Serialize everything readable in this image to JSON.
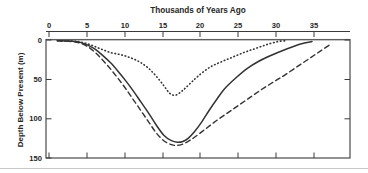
{
  "chart_data": {
    "type": "line",
    "title": "Thousands of Years Ago",
    "xlabel": "Thousands of Years Ago",
    "ylabel": "Depth Below Present (m)",
    "xlim": [
      -1.5,
      38.5
    ],
    "ylim": [
      0,
      150
    ],
    "y_inverted": true,
    "x_axis_position": "top",
    "grid": false,
    "legend": "none",
    "xticks": [
      0,
      5,
      10,
      15,
      20,
      25,
      30,
      35
    ],
    "xtick_labels": [
      "0",
      "5",
      "10",
      "15",
      "20",
      "25",
      "30",
      "35"
    ],
    "yticks": [
      0,
      50,
      100,
      150
    ],
    "ytick_labels": [
      "0",
      "50",
      "100",
      "150"
    ],
    "series": [
      {
        "name": "dotted-curve",
        "style": "dotted",
        "color": "#333333",
        "x": [
          0,
          2,
          3,
          4,
          5,
          6,
          7,
          8,
          9,
          10,
          11,
          12,
          13,
          14,
          14.8,
          15.6,
          16.5,
          17.5,
          18.5,
          20,
          21.5,
          23,
          24.5,
          26,
          27.5,
          29,
          30
        ],
        "y": [
          1,
          1.5,
          2.5,
          5,
          8.5,
          12.5,
          16,
          18,
          20.5,
          24,
          29,
          36,
          46,
          58,
          68,
          70,
          64,
          55,
          46,
          35,
          28,
          22,
          16,
          11,
          6,
          2,
          1
        ]
      },
      {
        "name": "solid-curve",
        "style": "solid",
        "color": "#333333",
        "x": [
          0,
          2,
          3,
          4,
          5,
          6,
          7,
          8,
          9,
          10,
          11,
          12,
          13,
          14,
          15,
          15.8,
          16.5,
          17.2,
          18,
          19,
          20,
          21,
          22,
          23.5,
          25,
          26.5,
          28,
          30,
          32,
          33.5
        ],
        "y": [
          1,
          1.5,
          3,
          6.5,
          12,
          20,
          29,
          40,
          52,
          65,
          79,
          93,
          108,
          121,
          128,
          130,
          129,
          125,
          117,
          104,
          89,
          75,
          62,
          48,
          36,
          27,
          20,
          12,
          5,
          2
        ]
      },
      {
        "name": "dashed-curve",
        "style": "dashed",
        "color": "#333333",
        "x": [
          0,
          2,
          3,
          4,
          5,
          6,
          7,
          8,
          9,
          10,
          11,
          12,
          13,
          14,
          15,
          15.6,
          16.3,
          17,
          18,
          19.5,
          21,
          22.5,
          24,
          25.5,
          27,
          28.5,
          30,
          32,
          34,
          36
        ],
        "y": [
          1,
          2,
          4,
          8.5,
          16,
          26,
          37,
          49,
          62,
          76,
          90,
          104,
          118,
          128,
          133,
          134,
          133,
          130,
          124,
          113,
          102,
          92,
          82,
          72,
          62,
          53,
          44,
          31,
          18,
          5
        ]
      }
    ]
  }
}
